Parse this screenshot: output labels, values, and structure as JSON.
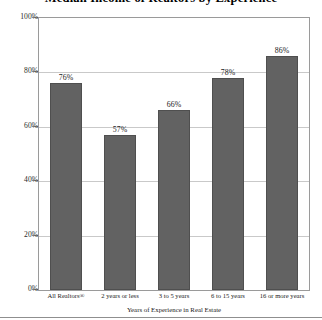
{
  "chart_data": {
    "type": "bar",
    "title": "Median Income of Realtors by Experience",
    "xlabel": "Years of Experience in Real Estate",
    "ylabel": "",
    "categories": [
      "All Realtors®",
      "2 years or less",
      "3 to 5 years",
      "6 to 15 years",
      "16 or more years"
    ],
    "values": [
      76,
      57,
      66,
      78,
      86
    ],
    "value_labels": [
      "76%",
      "57%",
      "66%",
      "78%",
      "86%"
    ],
    "ylim": [
      0,
      100
    ],
    "ytick_values": [
      100,
      80,
      60,
      40,
      20,
      0
    ],
    "ytick_labels": [
      "100%",
      "80%",
      "60%",
      "40%",
      "20%",
      "0%"
    ],
    "grid": true,
    "legend": "none",
    "bar_color": "#626262",
    "grid_color": "#c9c9c9",
    "frame_color": "#9a9a9a"
  }
}
